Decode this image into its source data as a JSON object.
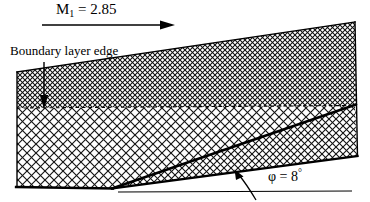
{
  "figure": {
    "background_color": "#ffffff",
    "line_color": "#000000",
    "mesh_color": "#1a1a1a",
    "width": 370,
    "height": 202
  },
  "annotations": {
    "mach": {
      "symbol": "M",
      "subscript": "1",
      "equals": " = ",
      "value": "2.85",
      "full_text": "M₁ = 2.85"
    },
    "boundary_layer": {
      "label": "Boundary layer edge"
    },
    "ramp_angle": {
      "symbol": "φ",
      "equals": " = ",
      "value": "8",
      "unit": "°",
      "full_text": "φ = 8°"
    }
  },
  "icons": {
    "flow_arrow": "right-arrow-icon",
    "boundary_pointer": "down-arrow-icon",
    "angle_arc": "curved-arrow-icon"
  }
}
